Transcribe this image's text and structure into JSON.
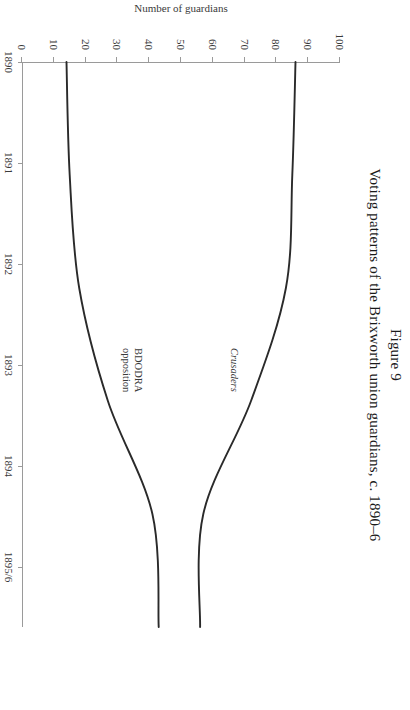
{
  "figure": {
    "number": "Figure 9",
    "caption": "Voting patterns of the Brixworth union guardians, c. 1890–6"
  },
  "chart_data": {
    "type": "line",
    "title": "Voting patterns of the Brixworth union guardians, c. 1890–6",
    "xlabel": "Date",
    "ylabel": "Number of guardians",
    "categories": [
      "1890",
      "1891",
      "1892",
      "1893",
      "1894",
      "1895/6"
    ],
    "xticklabels": [
      "1890",
      "1891",
      "1892",
      "1893",
      "1894",
      "1895/6"
    ],
    "yticklabels": [
      "0",
      "10",
      "20",
      "30",
      "40",
      "50",
      "60",
      "70",
      "80",
      "90",
      "100"
    ],
    "ylim": [
      0,
      100
    ],
    "ytick_step": 10,
    "grid": false,
    "legend": "inline-annotations",
    "series": [
      {
        "name": "Crusaders",
        "style": "italic",
        "values": [
          86,
          85,
          83,
          72,
          57,
          56
        ],
        "color": "#2a2a2a"
      },
      {
        "name": "BDODRA opposition",
        "style": "regular",
        "values": [
          14,
          15,
          18,
          27,
          41,
          43
        ],
        "color": "#2a2a2a"
      }
    ],
    "annotations": [
      {
        "text": "Crusaders",
        "near_x": "1893",
        "near_y": 62
      },
      {
        "text": "BDODRA opposition",
        "near_x": "1893",
        "near_y": 36
      }
    ],
    "crossing_point": {
      "x": "between 1894 and 1895/6",
      "y": 50
    }
  },
  "series_labels": {
    "crusaders": "Crusaders",
    "bdodra_line1": "BDODRA",
    "bdodra_line2": "opposition"
  },
  "colors": {
    "line": "#2a2a2a",
    "axis": "#9a9a9a",
    "text": "#1a1a1a",
    "background": "#ffffff"
  }
}
